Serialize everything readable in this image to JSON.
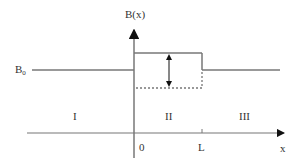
{
  "diagram": {
    "y_axis_label": "B(x)",
    "x_axis_label": "x",
    "baseline_label_main": "B",
    "baseline_label_sub": "0",
    "regions": [
      {
        "id": "I",
        "label": "I"
      },
      {
        "id": "II",
        "label": "II"
      },
      {
        "id": "III",
        "label": "III"
      }
    ],
    "ticks": [
      {
        "label": "0"
      },
      {
        "label": "L"
      }
    ],
    "colors": {
      "line": "#777777",
      "text": "#333333",
      "arrow": "#111111"
    }
  }
}
